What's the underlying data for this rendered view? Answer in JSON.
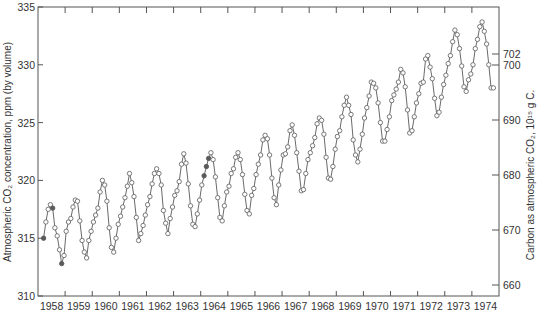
{
  "chart_data": {
    "type": "line",
    "title": "",
    "xlabel": "",
    "ylabel": "Atmospheric CO₂ concentration, ppm (by volume)",
    "y2label": "Carbon as atmospheric CO₂, 10¹⁵ g C.",
    "xlim": [
      1958,
      1975
    ],
    "ylim": [
      310,
      335
    ],
    "grid": false,
    "legend": null,
    "x_ticks": [
      "1958",
      "1959",
      "1960",
      "1961",
      "1962",
      "1963",
      "1964",
      "1965",
      "1966",
      "1967",
      "1968",
      "1969",
      "1970",
      "1971",
      "1972",
      "1973",
      "1974"
    ],
    "y_ticks": [
      "310",
      "315",
      "320",
      "325",
      "330",
      "335"
    ],
    "y2_ticks": [
      "660",
      "670",
      "680",
      "690",
      "700",
      "702"
    ],
    "series": [
      {
        "name": "Monthly mean atmospheric CO₂ (ppm)",
        "start": "1958-03",
        "frequency": "monthly",
        "interpolated_indices": [
          0,
          4,
          8,
          71,
          72,
          73
        ],
        "values": [
          315.0,
          316.4,
          317.5,
          317.9,
          317.6,
          315.9,
          315.2,
          314.0,
          312.8,
          313.5,
          315.6,
          316.4,
          316.7,
          317.7,
          318.3,
          318.2,
          316.5,
          314.8,
          313.8,
          313.3,
          314.8,
          315.6,
          316.4,
          317.0,
          317.6,
          319.0,
          320.0,
          319.6,
          318.2,
          315.9,
          314.2,
          313.8,
          315.0,
          316.2,
          316.9,
          317.7,
          318.5,
          319.5,
          320.6,
          319.8,
          318.6,
          316.8,
          314.8,
          315.4,
          316.1,
          317.0,
          317.9,
          318.6,
          319.7,
          320.6,
          321.0,
          320.6,
          319.6,
          317.4,
          316.3,
          315.4,
          316.7,
          317.7,
          318.7,
          319.1,
          319.9,
          321.4,
          322.3,
          321.5,
          319.7,
          317.8,
          316.2,
          316.0,
          317.1,
          318.3,
          319.6,
          320.4,
          321.2,
          321.9,
          322.4,
          321.8,
          320.3,
          318.5,
          316.8,
          316.5,
          317.8,
          319.0,
          319.5,
          320.6,
          321.0,
          322.0,
          322.4,
          321.8,
          320.5,
          318.8,
          317.4,
          317.1,
          318.7,
          319.3,
          320.5,
          321.4,
          322.2,
          323.5,
          323.9,
          323.6,
          322.2,
          320.2,
          318.5,
          317.9,
          319.6,
          320.9,
          322.2,
          322.3,
          322.9,
          324.3,
          324.8,
          323.9,
          322.4,
          320.8,
          319.1,
          319.2,
          320.6,
          321.8,
          322.4,
          323.0,
          323.7,
          324.9,
          325.4,
          325.2,
          324.0,
          322.0,
          320.2,
          320.1,
          321.2,
          322.7,
          323.8,
          324.3,
          325.5,
          326.5,
          327.2,
          326.5,
          325.7,
          323.5,
          322.2,
          321.6,
          322.7,
          324.0,
          325.4,
          326.3,
          327.3,
          328.5,
          328.4,
          328.0,
          326.7,
          325.0,
          323.4,
          323.4,
          324.4,
          325.5,
          326.9,
          327.4,
          327.9,
          328.5,
          329.6,
          329.3,
          328.1,
          326.1,
          324.1,
          324.3,
          325.5,
          326.7,
          327.5,
          328.4,
          328.5,
          330.5,
          330.8,
          329.8,
          328.8,
          327.1,
          325.6,
          325.9,
          327.2,
          328.3,
          329.1,
          330.1,
          330.8,
          332.0,
          333.0,
          332.6,
          331.4,
          329.9,
          328.1,
          327.7,
          328.7,
          329.2,
          330.0,
          331.4,
          332.2,
          333.3,
          333.7,
          332.9,
          331.8,
          330.0,
          328.0,
          328.0
        ]
      }
    ],
    "colors": {
      "line": "#6a6a6a",
      "marker_open_fill": "#ffffff",
      "marker_filled": "#5a5a5a",
      "axis": "#555555",
      "text": "#333333"
    }
  }
}
